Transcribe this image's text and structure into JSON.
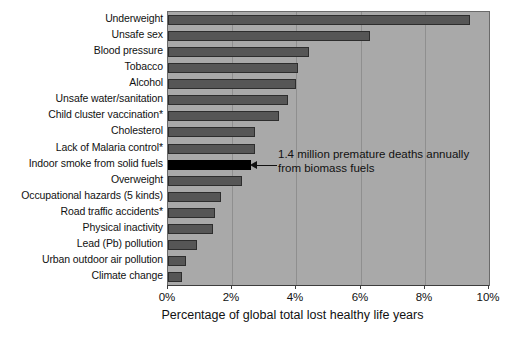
{
  "chart_data": {
    "type": "bar",
    "orientation": "horizontal",
    "title": "",
    "xlabel": "Percentage of global total lost healthy life years",
    "ylabel": "",
    "xlim": [
      0,
      10
    ],
    "xticks": [
      "0%",
      "2%",
      "4%",
      "6%",
      "8%",
      "10%"
    ],
    "xtick_values": [
      0,
      2,
      4,
      6,
      8,
      10
    ],
    "grid": true,
    "legend": "none",
    "categories": [
      "Underweight",
      "Unsafe sex",
      "Blood pressure",
      "Tobacco",
      "Alcohol",
      "Unsafe water/sanitation",
      "Child cluster vaccination*",
      "Cholesterol",
      "Lack of Malaria control*",
      "Indoor smoke from solid fuels",
      "Overweight",
      "Occupational hazards (5 kinds)",
      "Road traffic accidents*",
      "Physical inactivity",
      "Lead (Pb) pollution",
      "Urban outdoor air pollution",
      "Climate change"
    ],
    "values": [
      9.4,
      6.3,
      4.4,
      4.05,
      4.0,
      3.75,
      3.45,
      2.7,
      2.7,
      2.6,
      2.3,
      1.65,
      1.45,
      1.4,
      0.9,
      0.55,
      0.45
    ],
    "highlight_index": 9,
    "annotations": [
      {
        "target_category": "Indoor smoke from solid fuels",
        "line1": "1.4 million premature deaths annually",
        "line2": "from biomass fuels"
      }
    ],
    "colors": {
      "plot_background": "#a9a9a9",
      "bar_fill": "#565656",
      "bar_border": "#2d2d2d",
      "highlight_fill": "#000000",
      "gridline": "#8f8f8f",
      "axis": "#3d3d3d",
      "text": "#111111"
    }
  }
}
